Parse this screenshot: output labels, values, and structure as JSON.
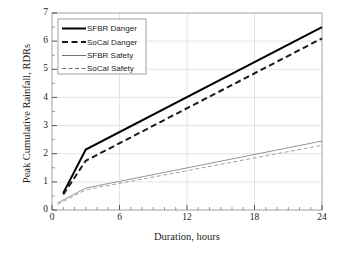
{
  "chart_data": {
    "type": "line",
    "title": "",
    "xlabel": "Duration, hours",
    "ylabel": "Peak Cumulative Rainfall, RDRs",
    "xlim": [
      0,
      24
    ],
    "ylim": [
      0,
      7
    ],
    "xticks": [
      0,
      6,
      12,
      18,
      24
    ],
    "yticks": [
      0,
      1,
      2,
      3,
      4,
      5,
      6,
      7
    ],
    "xtick_labels": [
      "0",
      "6",
      "12",
      "18",
      "24"
    ],
    "ytick_labels": [
      "0",
      "1",
      "2",
      "3",
      "4",
      "5",
      "6",
      "7"
    ],
    "grid": true,
    "minor_ticks": true,
    "legend_position": "upper left",
    "series": [
      {
        "name": "SFBR Danger",
        "style": "solid",
        "width": 2.0,
        "color": "#000000",
        "x": [
          1,
          3,
          24
        ],
        "y": [
          0.6,
          2.15,
          6.5
        ]
      },
      {
        "name": "SoCal Danger",
        "style": "dashed",
        "width": 2.0,
        "color": "#1a1a1a",
        "x": [
          1,
          3,
          24
        ],
        "y": [
          0.55,
          1.75,
          6.1
        ]
      },
      {
        "name": "SFBR Safety",
        "style": "solid",
        "width": 0.8,
        "color": "#7a7a7a",
        "x": [
          0.5,
          3,
          24
        ],
        "y": [
          0.25,
          0.78,
          2.45
        ]
      },
      {
        "name": "SoCal Safety",
        "style": "dashed",
        "width": 0.8,
        "color": "#8c8c8c",
        "x": [
          0.5,
          3,
          24
        ],
        "y": [
          0.2,
          0.72,
          2.3
        ]
      }
    ]
  },
  "legend": {
    "entries": [
      {
        "label": "SFBR Danger"
      },
      {
        "label": "SoCal  Danger"
      },
      {
        "label": "SFBR Safety"
      },
      {
        "label": "SoCal  Safety"
      }
    ]
  },
  "caption": {
    "partial_text": ""
  }
}
